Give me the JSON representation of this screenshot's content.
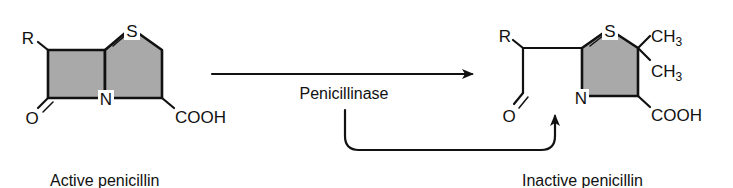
{
  "diagram": {
    "colors": {
      "ring_fill": "#a9a9a9",
      "line": "#111111",
      "background": "#ffffff"
    },
    "active": {
      "label": "Active penicillin",
      "atoms": {
        "r": "R",
        "s": "S",
        "n": "N",
        "o": "O",
        "cooh": "COOH"
      }
    },
    "reaction": {
      "enzyme": "Penicillinase"
    },
    "inactive": {
      "label": "Inactive penicillin",
      "atoms": {
        "r": "R",
        "s": "S",
        "n": "N",
        "o": "O",
        "ch3_top": "CH",
        "ch3_top_sub": "3",
        "ch3_bottom": "CH",
        "ch3_bottom_sub": "3",
        "cooh": "COOH"
      }
    }
  }
}
